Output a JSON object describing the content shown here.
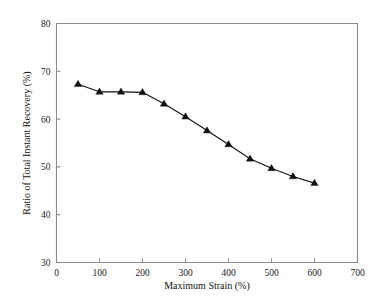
{
  "chart_data": {
    "type": "line",
    "title": "",
    "subtitle": "",
    "xlabel": "Maximum Strain (%)",
    "ylabel": "Ratio of Total Instant Recovery (%)",
    "xlim": [
      0,
      700
    ],
    "ylim": [
      30,
      80
    ],
    "xticks": [
      0,
      100,
      200,
      300,
      400,
      500,
      600,
      700
    ],
    "yticks": [
      30,
      40,
      50,
      60,
      70,
      80
    ],
    "xtick_labels": [
      "0",
      "100",
      "200",
      "300",
      "400",
      "500",
      "600",
      "700"
    ],
    "ytick_labels": [
      "30",
      "40",
      "50",
      "60",
      "70",
      "80"
    ],
    "grid": false,
    "legend": false,
    "legend_position": "none",
    "marker": "triangle-up",
    "marker_color": "#111111",
    "line_color": "#111111",
    "x": [
      50,
      100,
      150,
      200,
      250,
      300,
      350,
      400,
      450,
      500,
      550,
      600
    ],
    "values": [
      67.3,
      65.7,
      65.7,
      65.6,
      63.2,
      60.5,
      57.6,
      54.7,
      51.7,
      49.7,
      48.0,
      46.6
    ],
    "series": [
      {
        "name": "Ratio of Total Instant Recovery",
        "x": [
          50,
          100,
          150,
          200,
          250,
          300,
          350,
          400,
          450,
          500,
          550,
          600
        ],
        "values": [
          67.3,
          65.7,
          65.7,
          65.6,
          63.2,
          60.5,
          57.6,
          54.7,
          51.7,
          49.7,
          48.0,
          46.6
        ]
      }
    ],
    "annotations": []
  },
  "style": {
    "axis_color": "#8c8c8c",
    "text_color": "#111111",
    "background": "#ffffff"
  }
}
